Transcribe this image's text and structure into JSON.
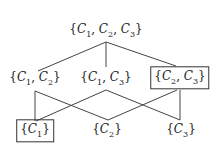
{
  "diagram": {
    "type": "lattice",
    "nodes": [
      {
        "id": "c123",
        "label": "{C1,C2,C3}",
        "x": 106,
        "y": 31,
        "boxed": false
      },
      {
        "id": "c12",
        "label": "{C1,C2}",
        "x": 35,
        "y": 79,
        "boxed": false
      },
      {
        "id": "c13",
        "label": "{C1,C3}",
        "x": 106,
        "y": 79,
        "boxed": false
      },
      {
        "id": "c23",
        "label": "{C2,C3}",
        "x": 180,
        "y": 79,
        "boxed": true
      },
      {
        "id": "c1",
        "label": "{C1}",
        "x": 35,
        "y": 131,
        "boxed": true
      },
      {
        "id": "c2",
        "label": "{C2}",
        "x": 107,
        "y": 131,
        "boxed": false
      },
      {
        "id": "c3",
        "label": "{C3}",
        "x": 181,
        "y": 131,
        "boxed": false
      }
    ],
    "edges": [
      [
        "c123",
        "c12"
      ],
      [
        "c123",
        "c13"
      ],
      [
        "c123",
        "c23"
      ],
      [
        "c12",
        "c1"
      ],
      [
        "c12",
        "c2"
      ],
      [
        "c13",
        "c1"
      ],
      [
        "c13",
        "c3"
      ],
      [
        "c23",
        "c2"
      ],
      [
        "c23",
        "c3"
      ]
    ]
  }
}
